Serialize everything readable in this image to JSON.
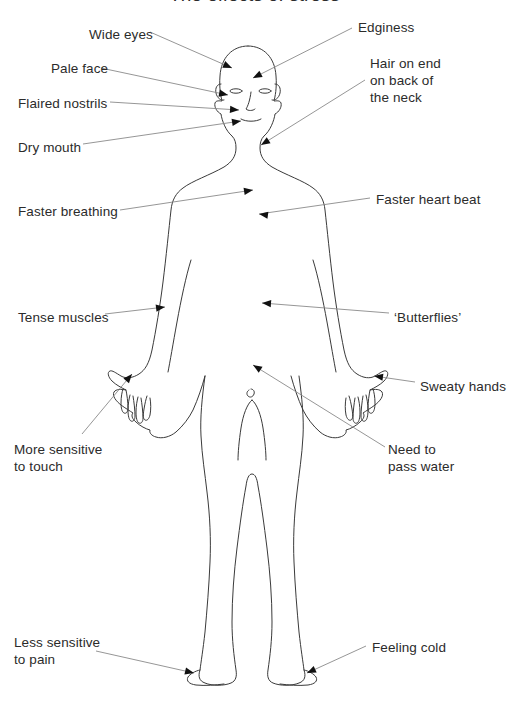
{
  "title": "The effects of stress",
  "diagram": {
    "name": "human-body-stress-symptoms",
    "width": 509,
    "height": 706,
    "line_color": "#3a3a3a",
    "leader_color": "#8a8a8a",
    "text_color": "#2b2b2b",
    "background": "#ffffff"
  },
  "labels": [
    {
      "id": "wide-eyes",
      "text": "Wide eyes",
      "x": 89,
      "y": 26,
      "align": "left",
      "target": "eyes"
    },
    {
      "id": "edginess",
      "text": "Edginess",
      "x": 358,
      "y": 19,
      "align": "left",
      "target": "forehead"
    },
    {
      "id": "pale-face",
      "text": "Pale face",
      "x": 51,
      "y": 60,
      "align": "left",
      "target": "cheek"
    },
    {
      "id": "hair-on-end",
      "text": "Hair on end\non back of\nthe neck",
      "x": 370,
      "y": 55,
      "align": "left",
      "target": "neck"
    },
    {
      "id": "flaired-nostrils",
      "text": "Flaired nostrils",
      "x": 18,
      "y": 95,
      "align": "left",
      "target": "nose"
    },
    {
      "id": "dry-mouth",
      "text": "Dry mouth",
      "x": 18,
      "y": 139,
      "align": "left",
      "target": "mouth"
    },
    {
      "id": "faster-breathing",
      "text": "Faster breathing",
      "x": 18,
      "y": 203,
      "align": "left",
      "target": "chest-left"
    },
    {
      "id": "faster-heart-beat",
      "text": "Faster heart beat",
      "x": 376,
      "y": 191,
      "align": "left",
      "target": "chest-right"
    },
    {
      "id": "tense-muscles",
      "text": "Tense muscles",
      "x": 18,
      "y": 309,
      "align": "left",
      "target": "arm-left"
    },
    {
      "id": "butterflies",
      "text": "‘Butterflies’",
      "x": 394,
      "y": 309,
      "align": "left",
      "target": "stomach"
    },
    {
      "id": "sweaty-hands",
      "text": "Sweaty hands",
      "x": 420,
      "y": 378,
      "align": "left",
      "target": "hand-right"
    },
    {
      "id": "more-sensitive-to-touch",
      "text": "More sensitive\nto touch",
      "x": 14,
      "y": 441,
      "align": "left",
      "target": "hand-left"
    },
    {
      "id": "need-to-pass-water",
      "text": "Need to\npass water",
      "x": 388,
      "y": 441,
      "align": "left",
      "target": "pelvis"
    },
    {
      "id": "less-sensitive-to-pain",
      "text": "Less sensitive\nto pain",
      "x": 14,
      "y": 634,
      "align": "left",
      "target": "foot-left"
    },
    {
      "id": "feeling-cold",
      "text": "Feeling cold",
      "x": 372,
      "y": 639,
      "align": "left",
      "target": "foot-right"
    }
  ],
  "leaders": [
    {
      "id": "leader-wide-eyes",
      "from": [
        150,
        32
      ],
      "to": [
        232,
        68
      ],
      "arrow_angle": 24
    },
    {
      "id": "leader-edginess",
      "from": [
        352,
        28
      ],
      "to": [
        253,
        78
      ],
      "arrow_angle": 205
    },
    {
      "id": "leader-pale-face",
      "from": [
        101,
        68
      ],
      "to": [
        228,
        95
      ],
      "arrow_angle": 12
    },
    {
      "id": "leader-hair-on-end",
      "from": [
        365,
        80
      ],
      "to": [
        261,
        145
      ],
      "arrow_angle": 212
    },
    {
      "id": "leader-flaired-nostrils",
      "from": [
        110,
        102
      ],
      "to": [
        239,
        110
      ],
      "arrow_angle": 4
    },
    {
      "id": "leader-dry-mouth",
      "from": [
        83,
        144
      ],
      "to": [
        241,
        120
      ],
      "arrow_angle": -9
    },
    {
      "id": "leader-faster-breathing",
      "from": [
        120,
        210
      ],
      "to": [
        253,
        190
      ],
      "arrow_angle": -9
    },
    {
      "id": "leader-faster-heart-beat",
      "from": [
        370,
        198
      ],
      "to": [
        259,
        214
      ],
      "arrow_angle": 188
    },
    {
      "id": "leader-tense-muscles",
      "from": [
        105,
        314
      ],
      "to": [
        165,
        307
      ],
      "arrow_angle": -7
    },
    {
      "id": "leader-butterflies",
      "from": [
        389,
        313
      ],
      "to": [
        262,
        303
      ],
      "arrow_angle": 184
    },
    {
      "id": "leader-sweaty-hands",
      "from": [
        415,
        382
      ],
      "to": [
        374,
        376
      ],
      "arrow_angle": 188
    },
    {
      "id": "leader-more-sensitive",
      "from": [
        82,
        434
      ],
      "to": [
        132,
        374
      ],
      "arrow_angle": -50
    },
    {
      "id": "leader-need-to-pass-water",
      "from": [
        385,
        447
      ],
      "to": [
        253,
        365
      ],
      "arrow_angle": 212
    },
    {
      "id": "leader-less-sensitive",
      "from": [
        96,
        651
      ],
      "to": [
        194,
        673
      ],
      "arrow_angle": 13
    },
    {
      "id": "leader-feeling-cold",
      "from": [
        366,
        646
      ],
      "to": [
        307,
        673
      ],
      "arrow_angle": 155
    }
  ]
}
